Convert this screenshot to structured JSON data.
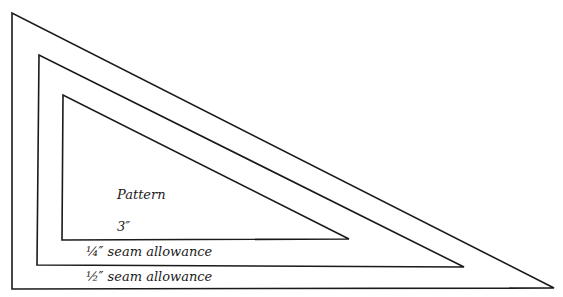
{
  "diagram": {
    "type": "nested right triangles (quilt pattern with seam allowances)",
    "stroke_color": "#1a1a1a",
    "background": "#ffffff",
    "triangles": [
      {
        "name": "outer",
        "points": "12,13 12,289 554,288"
      },
      {
        "name": "middle",
        "points": "39,55 37,265 464,267"
      },
      {
        "name": "inner",
        "points": "63,95 62,240 349,239"
      }
    ],
    "labels": {
      "pattern": "Pattern",
      "dimension": "3″",
      "quarter_seam": "¼″ seam allowance",
      "half_seam": "½″ seam allowance"
    }
  }
}
